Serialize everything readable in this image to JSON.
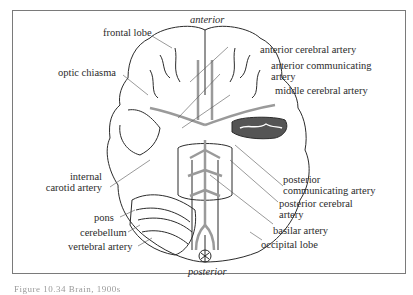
{
  "figure": {
    "orientation_top": "anterior",
    "orientation_bottom": "posterior",
    "caption": "Figure 10.34  Brain, 1900s",
    "colors": {
      "frame": "#7a7a7a",
      "ink": "#2b2b2b",
      "artery": "#9a9a9a",
      "temporal_cut": "#555555"
    }
  },
  "labels": {
    "left": [
      {
        "id": "frontal-lobe",
        "text": "frontal lobe"
      },
      {
        "id": "optic-chiasma",
        "text": "optic chiasma"
      },
      {
        "id": "internal-carotid-artery",
        "line1": "internal",
        "line2": "carotid artery"
      },
      {
        "id": "pons",
        "text": "pons"
      },
      {
        "id": "cerebellum",
        "text": "cerebellum"
      },
      {
        "id": "vertebral-artery",
        "text": "vertebral artery"
      }
    ],
    "right": [
      {
        "id": "anterior-cerebral-artery",
        "text": "anterior cerebral artery"
      },
      {
        "id": "anterior-communicating-artery",
        "line1": "anterior communicating",
        "line2": "artery"
      },
      {
        "id": "middle-cerebral-artery",
        "text": "middle cerebral artery"
      },
      {
        "id": "posterior-communicating-artery",
        "line1": "posterior",
        "line2": "communicating artery"
      },
      {
        "id": "posterior-cerebral-artery",
        "line1": "posterior cerebral",
        "line2": "artery"
      },
      {
        "id": "basilar-artery",
        "text": "basilar artery"
      },
      {
        "id": "occipital-lobe",
        "text": "occipital lobe"
      }
    ]
  }
}
